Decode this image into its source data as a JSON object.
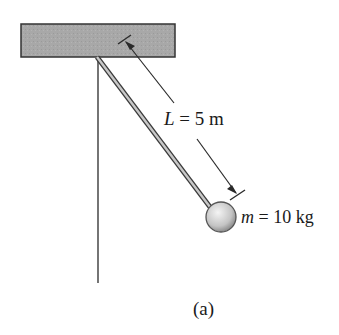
{
  "figure": {
    "caption": "(a)",
    "length_label": {
      "var": "L",
      "eq": " = 5 m"
    },
    "mass_label": {
      "var": "m",
      "eq": " = 10 kg"
    },
    "colors": {
      "ceiling_fill": "#a9a9a9",
      "ceiling_stroke": "#333333",
      "rod_fill": "#bdbdbd",
      "line": "#2a2a2a",
      "ball_light": "#f2f2f2",
      "ball_dark": "#9a9a9a"
    }
  }
}
